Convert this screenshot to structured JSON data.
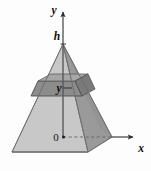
{
  "figure": {
    "canvas": {
      "width": 151,
      "height": 171,
      "background": "#fdfdfd"
    },
    "labels": {
      "y_axis": "y",
      "x_axis": "x",
      "height": "h",
      "origin": "0",
      "slab_height": "y"
    },
    "colors": {
      "front_face": "#bfbfbf",
      "left_face": "#cfcfcf",
      "right_face": "#949494",
      "base_top": "#c6c6c6",
      "slab_front": "#8f8f8f",
      "slab_top": "#a8a8a8",
      "slab_right": "#7c7c7c",
      "axis": "#4a4a4a",
      "outline": "#6f6f6f",
      "hidden_edge": "#8a8a8a",
      "text": "#141414"
    },
    "geometry": {
      "apex": [
        63,
        44
      ],
      "origin": [
        63,
        137
      ],
      "base_front": [
        52,
        152
      ],
      "base_left": [
        12,
        152
      ],
      "base_right": [
        112,
        137
      ],
      "base_back": [
        70,
        122
      ],
      "y_axis_top": [
        63,
        8
      ],
      "x_axis_right": [
        138,
        137
      ],
      "slab_top_y": 81,
      "slab_bottom_y": 96
    },
    "annotations": {
      "height_tick_y": 44,
      "slab_tick_right_x": 78
    }
  }
}
